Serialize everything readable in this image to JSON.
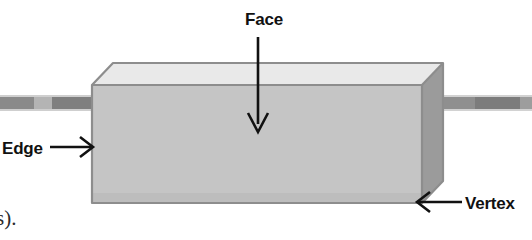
{
  "figure": {
    "background_color": "#ffffff",
    "width": 532,
    "height": 240
  },
  "solid": {
    "name": "rectangular-prism",
    "front_face_color": "#c5c5c5",
    "top_face_color": "#e9e9e9",
    "side_face_color": "#9b9b9b",
    "outline_color": "#8d8d8d"
  },
  "callouts": [
    {
      "id": "face",
      "label": "Face",
      "pointer": "arrow-down",
      "target": "front-face"
    },
    {
      "id": "edge",
      "label": "Edge",
      "pointer": "arrow-right",
      "target": "left-vertical-edge"
    },
    {
      "id": "vertex",
      "label": "Vertex",
      "pointer": "arrow-left",
      "target": "bottom-right-vertex"
    }
  ],
  "scan_artifacts": {
    "left_bar_color": "#8e8e8e",
    "right_bar_color": "#8e8e8e"
  },
  "page_fragment": {
    "clipped_text": "s)."
  }
}
